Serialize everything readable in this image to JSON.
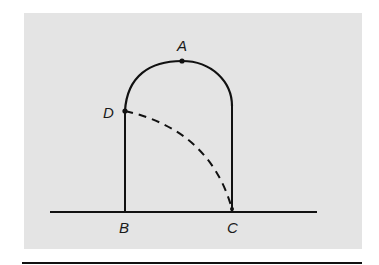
{
  "figure": {
    "labels": {
      "A": "A",
      "B": "B",
      "C": "C",
      "D": "D"
    },
    "points": {
      "A": {
        "x": 182,
        "y": 61
      },
      "B": {
        "x": 125,
        "y": 212
      },
      "C": {
        "x": 232,
        "y": 211
      },
      "D": {
        "x": 125,
        "y": 111
      }
    },
    "colors": {
      "background_panel": "#e4e4e4",
      "stroke": "#111111"
    },
    "elements": [
      "ground line",
      "left wall B-D",
      "right wall C up to arc",
      "semicircular arch through A",
      "dashed curve from D to C"
    ]
  }
}
